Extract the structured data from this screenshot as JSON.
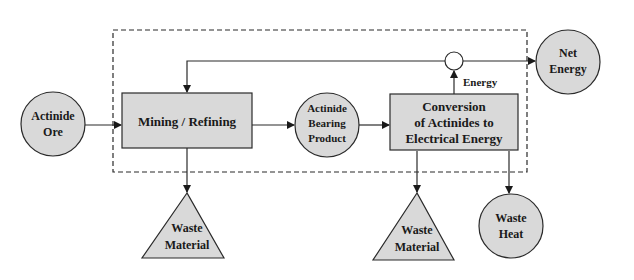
{
  "diagram": {
    "type": "process-flow",
    "boundary": {
      "style": "dashed"
    },
    "nodes": {
      "actinide_ore": {
        "shape": "circle",
        "line1": "Actinide",
        "line2": "Ore"
      },
      "mining_refining": {
        "shape": "rectangle",
        "label": "Mining / Refining"
      },
      "actinide_bearing_product": {
        "shape": "circle",
        "line1": "Actinide",
        "line2": "Bearing",
        "line3": "Product"
      },
      "conversion": {
        "shape": "rectangle",
        "line1": "Conversion",
        "line2": "of Actinides to",
        "line3": "Electrical Energy"
      },
      "junction": {
        "shape": "small-circle"
      },
      "net_energy": {
        "shape": "circle",
        "line1": "Net",
        "line2": "Energy"
      },
      "waste_material_1": {
        "shape": "triangle",
        "line1": "Waste",
        "line2": "Material"
      },
      "waste_material_2": {
        "shape": "triangle",
        "line1": "Waste",
        "line2": "Material"
      },
      "waste_heat": {
        "shape": "circle",
        "line1": "Waste",
        "line2": "Heat"
      }
    },
    "edge_labels": {
      "energy": "Energy"
    },
    "edges": [
      {
        "from": "actinide_ore",
        "to": "mining_refining"
      },
      {
        "from": "mining_refining",
        "to": "actinide_bearing_product"
      },
      {
        "from": "actinide_bearing_product",
        "to": "conversion"
      },
      {
        "from": "conversion",
        "to": "junction",
        "label": "Energy"
      },
      {
        "from": "junction",
        "to": "net_energy"
      },
      {
        "from": "junction",
        "to": "mining_refining",
        "note": "feedback"
      },
      {
        "from": "mining_refining",
        "to": "waste_material_1"
      },
      {
        "from": "conversion",
        "to": "waste_material_2"
      },
      {
        "from": "conversion",
        "to": "waste_heat"
      }
    ],
    "colors": {
      "node_fill": "#d9d9d9",
      "stroke": "#2a2a2a",
      "background": "#ffffff"
    }
  }
}
